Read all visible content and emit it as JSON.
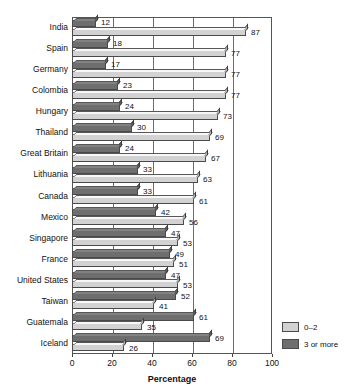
{
  "chart_data": {
    "type": "bar",
    "orientation": "horizontal",
    "title": "",
    "xlabel": "Percentage",
    "ylabel": "",
    "xlim": [
      0,
      100
    ],
    "xticks": [
      0,
      20,
      40,
      60,
      80,
      100
    ],
    "grid": "vertical",
    "legend_position": "bottom-right",
    "categories": [
      "India",
      "Spain",
      "Germany",
      "Colombia",
      "Hungary",
      "Thailand",
      "Great Britain",
      "Lithuania",
      "Canada",
      "Mexico",
      "Singapore",
      "France",
      "United States",
      "Taiwan",
      "Guatemala",
      "Iceland"
    ],
    "series": [
      {
        "name": "3 or more",
        "color": "#6e6e6e",
        "values": [
          12,
          18,
          17,
          23,
          24,
          30,
          24,
          33,
          33,
          42,
          47,
          49,
          47,
          52,
          61,
          69
        ]
      },
      {
        "name": "0–2",
        "color": "#d2d2d2",
        "values": [
          87,
          77,
          77,
          77,
          73,
          69,
          67,
          63,
          61,
          56,
          53,
          51,
          53,
          41,
          35,
          26
        ]
      }
    ]
  },
  "legend": {
    "items": [
      {
        "label": "0–2",
        "color": "#d2d2d2"
      },
      {
        "label": "3 or more",
        "color": "#6e6e6e"
      }
    ]
  }
}
